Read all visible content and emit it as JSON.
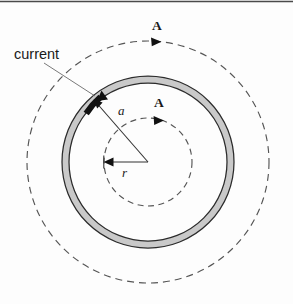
{
  "figure": {
    "type": "physics-diagram",
    "width": 293,
    "height": 304,
    "background_color": "#fdfdfd",
    "top_border_color": "#4a4a4a"
  },
  "labels": {
    "current": "current",
    "field_outer": "A",
    "field_inner": "A",
    "radius_ring": "a",
    "radius_amperian": "r"
  },
  "colors": {
    "ring_fill": "#cccccc",
    "ring_stroke": "#2b2b2b",
    "dashed_stroke": "#555555",
    "leader_stroke": "#666666",
    "arrow_fill": "#111111",
    "text": "#1a1a1a"
  },
  "geometry": {
    "center": {
      "x": 148,
      "y": 162
    },
    "ring_outer_radius": 86,
    "ring_inner_radius": 79,
    "amperian_inner_radius": 44,
    "amperian_outer_radius": 121
  },
  "annotations": {
    "current_label_position": {
      "x": 14,
      "y": 56
    },
    "field_outer_label_position": {
      "x": 155,
      "y": 31
    },
    "field_inner_label_position": {
      "x": 155,
      "y": 108
    },
    "radius_ring_label_position": {
      "x": 120,
      "y": 113
    },
    "radius_amperian_label_position": {
      "x": 124,
      "y": 175
    }
  }
}
